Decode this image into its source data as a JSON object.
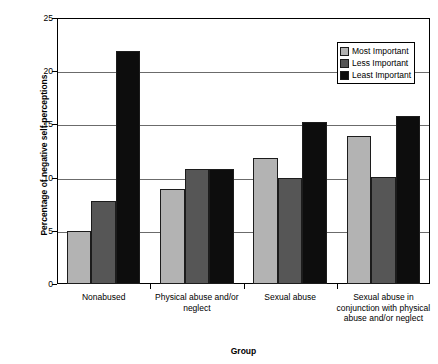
{
  "chart_data": {
    "type": "bar",
    "title": "",
    "xlabel": "Group",
    "ylabel": "Percentage of negative self-perceptions",
    "ylim": [
      0,
      25
    ],
    "yticks": [
      0,
      5,
      10,
      15,
      20,
      25
    ],
    "grid": true,
    "legend_position": "top-right",
    "categories": [
      "Nonabused",
      "Physical abuse and/or neglect",
      "Sexual abuse",
      "Sexual abuse in conjunction with physical abuse and/or neglect"
    ],
    "series": [
      {
        "name": "Most Important",
        "color": "#b3b3b3",
        "values": [
          5.0,
          8.9,
          11.8,
          13.9
        ]
      },
      {
        "name": "Less Important",
        "color": "#565656",
        "values": [
          7.8,
          10.8,
          10.0,
          10.1
        ]
      },
      {
        "name": "Least Important",
        "color": "#0d0d0d",
        "values": [
          21.9,
          10.8,
          15.2,
          15.8
        ]
      }
    ]
  },
  "axis": {
    "y_title": "Percentage of negative self-perceptions",
    "x_title": "Group",
    "y_tick_labels": [
      "25",
      "20",
      "15",
      "10",
      "5",
      "0"
    ],
    "x_tick_labels": [
      "Nonabused",
      "Physical abuse and/or neglect",
      "Sexual abuse",
      "Sexual abuse in conjunction with physical abuse and/or neglect"
    ]
  },
  "legend": {
    "items": [
      {
        "label": "Most Important",
        "color": "#b3b3b3"
      },
      {
        "label": "Less Important",
        "color": "#565656"
      },
      {
        "label": "Least Important",
        "color": "#0d0d0d"
      }
    ]
  }
}
